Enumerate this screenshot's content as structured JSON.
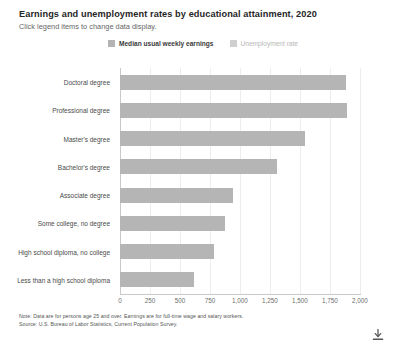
{
  "header": {
    "title": "Earnings and unemployment rates by educational attainment, 2020",
    "subtitle": "Click legend items to change data display."
  },
  "legend": {
    "position": "top-center",
    "items": [
      {
        "label": "Median usual weekly earnings",
        "state": "active",
        "color": "#b3b3b3"
      },
      {
        "label": "Unemployment rate",
        "state": "inactive",
        "color": "#cfcfcf"
      }
    ]
  },
  "footer": {
    "note": "Note: Data are for persons age 25 and over. Earnings are for full-time wage and salary workers.",
    "source": "Source: U.S. Bureau of Labor Statistics, Current Population Survey.",
    "download_icon": "download-icon"
  },
  "chart_data": {
    "type": "bar",
    "orientation": "horizontal",
    "title": "Earnings and unemployment rates by educational attainment, 2020",
    "xlabel": "",
    "ylabel": "",
    "xlim": [
      0,
      2000
    ],
    "grid": true,
    "bar_color": "#b5b5b5",
    "categories": [
      "Doctoral degree",
      "Professional degree",
      "Master's degree",
      "Bachelor's degree",
      "Associate degree",
      "Some college, no degree",
      "High school diploma, no college",
      "Less than a high school diploma"
    ],
    "series": [
      {
        "name": "Median usual weekly earnings",
        "values": [
          1885,
          1893,
          1545,
          1305,
          938,
          877,
          781,
          619
        ]
      }
    ],
    "xticks": [
      0,
      250,
      500,
      750,
      1000,
      1250,
      1500,
      1750,
      2000
    ],
    "xticklabels": [
      "0",
      "250",
      "500",
      "750",
      "1,000",
      "1,250",
      "1,500",
      "1,750",
      "2,000"
    ]
  }
}
